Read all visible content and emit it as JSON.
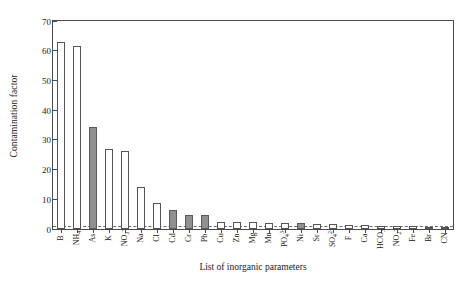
{
  "chart_data": {
    "type": "bar",
    "title": "",
    "xlabel": "List of inorganic parameters",
    "ylabel": "Contamination factor",
    "ylim": [
      0,
      70
    ],
    "yticks": [
      0,
      10,
      20,
      30,
      40,
      50,
      60,
      70
    ],
    "grid": false,
    "legend": "none",
    "reference_line": 1.0,
    "categories": [
      "B",
      "NH4",
      "As",
      "K",
      "NO3",
      "Na",
      "Cl",
      "Cd",
      "Cr",
      "Pb",
      "Cu",
      "Zn",
      "Mg",
      "Mn",
      "PO4",
      "Ni",
      "Sr",
      "SO4",
      "F",
      "Ca",
      "HCO3",
      "NO2",
      "Fe",
      "Br",
      "CN"
    ],
    "categories_html": [
      "B",
      "NH<sub>4</sub>",
      "As",
      "K",
      "NO<sub>3</sub><sup>-</sup>",
      "Na",
      "Cl",
      "Cd",
      "Cr",
      "Pb",
      "Cu",
      "Zn",
      "Mg",
      "Mn",
      "PO<sub>4</sub><sup>3-</sup>",
      "Ni",
      "Sr",
      "SO<sub>4</sub><sup>2-</sup>",
      "F",
      "Ca",
      "HCO<sub>3</sub><sup>-</sup>",
      "NO<sub>2</sub><sup>-</sup>",
      "Fe",
      "Br",
      "CN"
    ],
    "values": [
      63.0,
      61.6,
      34.3,
      27.0,
      26.2,
      14.2,
      8.8,
      6.3,
      4.6,
      4.6,
      2.5,
      2.4,
      2.2,
      2.1,
      2.0,
      1.9,
      1.7,
      1.6,
      1.4,
      1.2,
      1.1,
      1.0,
      0.9,
      0.7,
      0.6
    ],
    "bar_styles": [
      "open",
      "open",
      "fill",
      "open",
      "open",
      "open",
      "open",
      "fill",
      "fill",
      "fill",
      "open",
      "open",
      "open",
      "open",
      "open",
      "fill",
      "open",
      "open",
      "open",
      "open",
      "open",
      "open",
      "open",
      "open",
      "open"
    ],
    "colors": {
      "filled_bar": "#8f8f8f",
      "open_bar": "#ffffff",
      "bar_edge": "#555555",
      "axis": "#4a4a4a",
      "reference_line": "#6a6a6a",
      "text": "#1a1a1a"
    }
  }
}
